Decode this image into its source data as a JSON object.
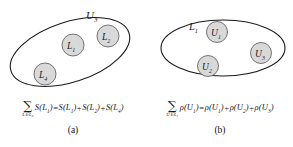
{
  "figure": {
    "width": 293,
    "height": 147,
    "background": "#ffffff",
    "stroke_color": "#1a1a1a",
    "circle_fill": "#d9d9d9"
  },
  "panels": [
    {
      "id": "a",
      "caption": "(a)",
      "outer_set": {
        "name": "outer-set-U3",
        "label_base": "U",
        "label_sub": "3"
      },
      "inner_sets": [
        {
          "name": "inner-set-L1",
          "label_base": "L",
          "label_sub": "1",
          "cx": 73,
          "cy": 45,
          "r": 11
        },
        {
          "name": "inner-set-L2",
          "label_base": "L",
          "label_sub": "2",
          "cx": 108,
          "cy": 36,
          "r": 11
        },
        {
          "name": "inner-set-L4",
          "label_base": "L",
          "label_sub": "4",
          "cx": 45,
          "cy": 74,
          "r": 11
        }
      ],
      "equation": {
        "sum_symbol": "∑",
        "sum_subscript": "L∈L₃",
        "lhs_fn": "S",
        "lhs_arg_base": "L",
        "lhs_arg_sub": "1",
        "equals": "=",
        "plus": "+",
        "rhs_terms": [
          {
            "fn": "S",
            "arg_base": "L",
            "arg_sub": "1"
          },
          {
            "fn": "S",
            "arg_base": "L",
            "arg_sub": "2"
          },
          {
            "fn": "S",
            "arg_base": "L",
            "arg_sub": "4"
          }
        ]
      }
    },
    {
      "id": "b",
      "caption": "(b)",
      "outer_set": {
        "name": "outer-set-L1",
        "label_base": "L",
        "label_sub": "1"
      },
      "inner_sets": [
        {
          "name": "inner-set-U1",
          "label_base": "U",
          "label_sub": "1",
          "cx": 70,
          "cy": 32,
          "r": 10.5
        },
        {
          "name": "inner-set-U3",
          "label_base": "U",
          "label_sub": "3",
          "cx": 114,
          "cy": 53,
          "r": 10.5
        },
        {
          "name": "inner-set-U2",
          "label_base": "U",
          "label_sub": "2",
          "cx": 61,
          "cy": 66,
          "r": 10.5
        }
      ],
      "equation": {
        "sum_symbol": "∑",
        "sum_subscript": "U∈L₁",
        "lhs_fn": "ρ",
        "lhs_arg_base": "U",
        "lhs_arg_sub": "1",
        "equals": "=",
        "plus": "+",
        "rhs_terms": [
          {
            "fn": "ρ",
            "arg_base": "U",
            "arg_sub": "1"
          },
          {
            "fn": "ρ",
            "arg_base": "U",
            "arg_sub": "2"
          },
          {
            "fn": "ρ",
            "arg_base": "U",
            "arg_sub": "3"
          }
        ]
      }
    }
  ]
}
